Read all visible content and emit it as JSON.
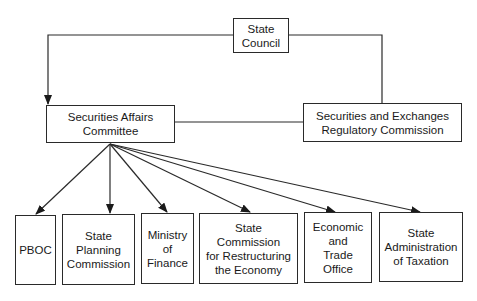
{
  "diagram": {
    "type": "organizational-chart",
    "top": {
      "id": "state-council",
      "label": "State\nCouncil"
    },
    "middle": [
      {
        "id": "securities-affairs-committee",
        "label": "Securities Affairs\nCommittee"
      },
      {
        "id": "serc",
        "label": "Securities and Exchanges\nRegulatory Commission"
      }
    ],
    "bottom": [
      {
        "id": "pboc",
        "label": "PBOC"
      },
      {
        "id": "state-planning-commission",
        "label": "State\nPlanning\nCommission"
      },
      {
        "id": "ministry-of-finance",
        "label": "Ministry\nof\nFinance"
      },
      {
        "id": "state-commission-restructuring",
        "label": "State\nCommission\nfor Restructuring\nthe Economy"
      },
      {
        "id": "economic-trade-office",
        "label": "Economic\nand\nTrade\nOffice"
      },
      {
        "id": "state-admin-taxation",
        "label": "State\nAdministration\nof Taxation"
      }
    ],
    "edges": [
      {
        "from": "state-council",
        "to": "securities-affairs-committee",
        "arrow": true
      },
      {
        "from": "state-council",
        "to": "serc",
        "arrow": false
      },
      {
        "from": "securities-affairs-committee",
        "to": "serc",
        "arrow": false
      },
      {
        "from": "securities-affairs-committee",
        "to": "pboc",
        "arrow": true
      },
      {
        "from": "securities-affairs-committee",
        "to": "state-planning-commission",
        "arrow": true
      },
      {
        "from": "securities-affairs-committee",
        "to": "ministry-of-finance",
        "arrow": true
      },
      {
        "from": "securities-affairs-committee",
        "to": "state-commission-restructuring",
        "arrow": true
      },
      {
        "from": "securities-affairs-committee",
        "to": "economic-trade-office",
        "arrow": true
      },
      {
        "from": "securities-affairs-committee",
        "to": "state-admin-taxation",
        "arrow": true
      }
    ]
  }
}
